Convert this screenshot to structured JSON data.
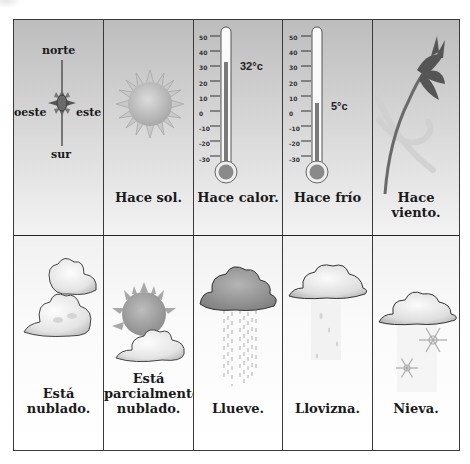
{
  "grid": {
    "row1": [
      {
        "id": "direcciones",
        "icon": "compass-icon",
        "compass": {
          "north": "norte",
          "west": "oeste",
          "east": "este",
          "south": "sur"
        },
        "label": ""
      },
      {
        "id": "sol",
        "icon": "sun-icon",
        "label": "Hace sol."
      },
      {
        "id": "calor",
        "icon": "thermometer-hot-icon",
        "label": "Hace calor.",
        "reading": "32°c",
        "scale": [
          "50",
          "40",
          "30",
          "20",
          "10",
          "0",
          "-10",
          "-20",
          "-30"
        ],
        "value": 32
      },
      {
        "id": "frio",
        "icon": "thermometer-cold-icon",
        "label": "Hace frío",
        "reading": "5°c",
        "scale": [
          "50",
          "40",
          "30",
          "20",
          "10",
          "0",
          "-10",
          "-20",
          "-30"
        ],
        "value": 5
      },
      {
        "id": "viento",
        "icon": "wind-flower-icon",
        "label": "Hace viento."
      }
    ],
    "row2": [
      {
        "id": "nublado",
        "icon": "clouds-icon",
        "label": "Está nublado."
      },
      {
        "id": "parcial",
        "icon": "partly-cloudy-icon",
        "label_lines": [
          "Está",
          "parcialmente",
          "nublado."
        ]
      },
      {
        "id": "llueve",
        "icon": "rain-cloud-icon",
        "label": "Llueve."
      },
      {
        "id": "llovizna",
        "icon": "drizzle-cloud-icon",
        "label": "Llovizna."
      },
      {
        "id": "nieva",
        "icon": "snow-cloud-icon",
        "label": "Nieva."
      }
    ]
  },
  "colors": {
    "border": "#3a3a3a",
    "row1_top": "#bdbdbd",
    "row1_bottom": "#f3f3f3",
    "text": "#1a1a1a",
    "mercury": "#7a7a7a"
  }
}
